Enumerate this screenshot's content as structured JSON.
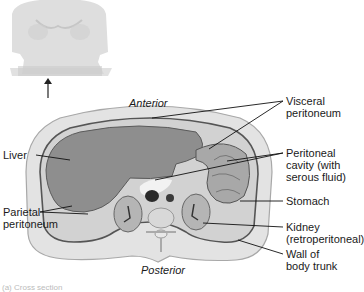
{
  "diagram": {
    "orientation": {
      "top": "Anterior",
      "bottom": "Posterior"
    },
    "labels": {
      "visceral_peritoneum": [
        "Visceral",
        "peritoneum"
      ],
      "peritoneal_cavity": [
        "Peritoneal",
        "cavity (with",
        "serous fluid)"
      ],
      "stomach": [
        "Stomach"
      ],
      "kidney": [
        "Kidney",
        "(retroperitoneal)"
      ],
      "wall": [
        "Wall of",
        "body trunk"
      ],
      "liver": [
        "Liver"
      ],
      "parietal_peritoneum": [
        "Parietal",
        "peritoneum"
      ]
    },
    "caption": "(a) Cross section"
  },
  "colors": {
    "body_wall": "#e4e4e4",
    "wall_outline": "#9a9a9a",
    "organ_fill": "#8c8c8c",
    "cavity_fill": "#cfcfcf",
    "leader_line": "#111111"
  }
}
